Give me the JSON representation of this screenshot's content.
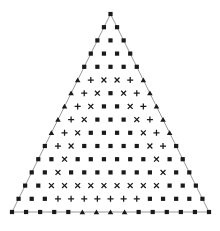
{
  "figure": {
    "width": 220,
    "height": 231,
    "background_color": "#ffffff",
    "marker_color": "#1a1a1a",
    "outline_color": "#808080",
    "outline_width": 0.8,
    "apex": {
      "x": 110.5,
      "y": 14.0
    },
    "base_left": {
      "x": 12.0,
      "y": 212.0
    },
    "base_right": {
      "x": 209.0,
      "y": 212.0
    },
    "rows": 15,
    "marker_size": 4.2,
    "legend": {
      "square": "filled-square-marker",
      "plus": "plus-marker",
      "cross": "x-cross-marker",
      "triangle": "filled-triangle-marker"
    }
  },
  "chart_data": {
    "type": "scatter",
    "xlabel": "",
    "ylabel": "",
    "grid": false,
    "legend_position": "none",
    "xlim": [
      0,
      220
    ],
    "ylim": [
      231,
      0
    ],
    "row_counts": [
      1,
      2,
      3,
      4,
      5,
      6,
      7,
      8,
      9,
      10,
      11,
      12,
      13,
      14,
      15
    ],
    "marker_glyphs": [
      "square",
      "plus",
      "cross",
      "triangle"
    ],
    "rows": [
      {
        "row": 1,
        "markers": [
          "square"
        ]
      },
      {
        "row": 2,
        "markers": [
          "square",
          "square"
        ]
      },
      {
        "row": 3,
        "markers": [
          "square",
          "square",
          "square"
        ]
      },
      {
        "row": 4,
        "markers": [
          "square",
          "square",
          "square",
          "square"
        ]
      },
      {
        "row": 5,
        "markers": [
          "square",
          "square",
          "square",
          "square",
          "square"
        ]
      },
      {
        "row": 6,
        "markers": [
          "triangle",
          "plus",
          "cross",
          "cross",
          "plus",
          "triangle"
        ]
      },
      {
        "row": 7,
        "markers": [
          "triangle",
          "plus",
          "cross",
          "square",
          "cross",
          "plus",
          "triangle"
        ]
      },
      {
        "row": 8,
        "markers": [
          "triangle",
          "plus",
          "cross",
          "square",
          "square",
          "cross",
          "plus",
          "triangle"
        ]
      },
      {
        "row": 9,
        "markers": [
          "triangle",
          "plus",
          "cross",
          "square",
          "square",
          "square",
          "cross",
          "plus",
          "triangle"
        ]
      },
      {
        "row": 10,
        "markers": [
          "triangle",
          "plus",
          "cross",
          "square",
          "square",
          "square",
          "square",
          "cross",
          "plus",
          "triangle"
        ]
      },
      {
        "row": 11,
        "markers": [
          "square",
          "plus",
          "cross",
          "square",
          "square",
          "square",
          "square",
          "square",
          "cross",
          "plus",
          "square"
        ]
      },
      {
        "row": 12,
        "markers": [
          "square",
          "square",
          "cross",
          "square",
          "square",
          "square",
          "square",
          "square",
          "square",
          "cross",
          "square",
          "square"
        ]
      },
      {
        "row": 13,
        "markers": [
          "square",
          "square",
          "cross",
          "square",
          "square",
          "square",
          "square",
          "square",
          "square",
          "square",
          "cross",
          "square",
          "square"
        ]
      },
      {
        "row": 14,
        "markers": [
          "square",
          "square",
          "cross",
          "cross",
          "cross",
          "cross",
          "cross",
          "cross",
          "cross",
          "cross",
          "cross",
          "square",
          "square",
          "square"
        ]
      },
      {
        "row": 15,
        "markers": [
          "square",
          "square",
          "square",
          "plus",
          "plus",
          "plus",
          "plus",
          "plus",
          "plus",
          "plus",
          "square",
          "square",
          "square",
          "square",
          "square"
        ]
      },
      {
        "row": 16,
        "markers": [
          "square",
          "square",
          "square",
          "square",
          "square",
          "triangle",
          "triangle",
          "triangle",
          "triangle",
          "square",
          "square",
          "square",
          "square",
          "square",
          "square"
        ]
      }
    ],
    "counts_by_glyph": {
      "square": 84,
      "plus": 22,
      "cross": 26,
      "triangle": 24
    }
  }
}
